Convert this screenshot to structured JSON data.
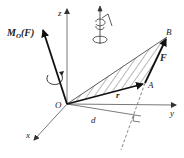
{
  "diagram": {
    "type": "3d-vector-moment",
    "colors": {
      "ink": "#1a1a1a",
      "axis": "#555555",
      "hatch": "#333333",
      "background": "#ffffff"
    },
    "labels": {
      "moment": "M",
      "moment_sub": "O",
      "moment_arg": "(F)",
      "z": "z",
      "y": "y",
      "x": "x",
      "origin": "O",
      "point_a": "A",
      "point_b": "B",
      "force": "F",
      "position": "r",
      "distance": "d"
    },
    "points": {
      "O": [
        67,
        104
      ],
      "A": [
        145,
        83
      ],
      "B": [
        167,
        37
      ],
      "z_end": [
        67,
        8
      ],
      "y_end": [
        176,
        105
      ],
      "x_end": [
        33,
        141
      ],
      "M_end": [
        42,
        28
      ],
      "perp_foot": [
        141,
        116
      ]
    },
    "icons": [
      "right-hand-rule-icon",
      "rotation-arrow-icon"
    ]
  }
}
